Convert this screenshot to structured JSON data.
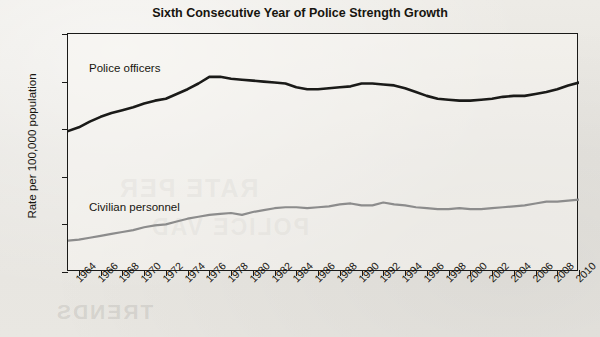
{
  "chart_data": {
    "type": "line",
    "title": "Sixth Consecutive Year of Police Strength Growth",
    "xlabel": "",
    "ylabel": "Rate per 100,000 population",
    "ylim": [
      0,
      250
    ],
    "yticks": [
      0,
      50,
      100,
      150,
      200,
      250
    ],
    "xlim": [
      1963,
      2010
    ],
    "xticks": [
      1964,
      1966,
      1968,
      1970,
      1972,
      1974,
      1976,
      1978,
      1980,
      1982,
      1984,
      1986,
      1988,
      1990,
      1992,
      1994,
      1996,
      1998,
      2000,
      2002,
      2004,
      2006,
      2008,
      2010
    ],
    "grid": false,
    "legend_position": "inline-annotation",
    "x": [
      1963,
      1964,
      1965,
      1966,
      1967,
      1968,
      1969,
      1970,
      1971,
      1972,
      1973,
      1974,
      1975,
      1976,
      1977,
      1978,
      1979,
      1980,
      1981,
      1982,
      1983,
      1984,
      1985,
      1986,
      1987,
      1988,
      1989,
      1990,
      1991,
      1992,
      1993,
      1994,
      1995,
      1996,
      1997,
      1998,
      1999,
      2000,
      2001,
      2002,
      2003,
      2004,
      2005,
      2006,
      2007,
      2008,
      2009,
      2010
    ],
    "series": [
      {
        "name": "Police officers",
        "color": "#1a1a18",
        "width": 2.6,
        "values": [
          148,
          152,
          158,
          163,
          167,
          170,
          173,
          177,
          180,
          182,
          187,
          192,
          198,
          205,
          205,
          203,
          202,
          201,
          200,
          199,
          198,
          194,
          192,
          192,
          193,
          194,
          195,
          198,
          198,
          197,
          196,
          193,
          189,
          185,
          182,
          181,
          180,
          180,
          181,
          182,
          184,
          185,
          185,
          187,
          189,
          192,
          196,
          199
        ]
      },
      {
        "name": "Civilian personnel",
        "color": "#8c8c8c",
        "width": 2.2,
        "values": [
          33,
          34,
          36,
          38,
          40,
          42,
          44,
          47,
          49,
          50,
          53,
          56,
          58,
          60,
          61,
          62,
          60,
          63,
          65,
          67,
          68,
          68,
          67,
          68,
          69,
          71,
          72,
          70,
          70,
          73,
          71,
          70,
          68,
          67,
          66,
          66,
          67,
          66,
          66,
          67,
          68,
          69,
          70,
          72,
          74,
          74,
          75,
          76
        ]
      }
    ],
    "annotations": [
      {
        "text": "Police officers",
        "name": "police-officers-label"
      },
      {
        "text": "Civilian personnel",
        "name": "civilian-personnel-label"
      }
    ]
  },
  "ghost_text": {
    "line_a": "RATE PER",
    "line_b": "POLICE VAD",
    "line_c": "TRENDS"
  }
}
